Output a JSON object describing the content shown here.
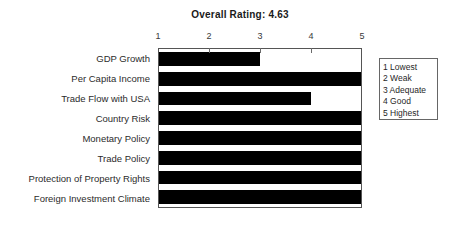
{
  "chart_data": {
    "type": "bar",
    "orientation": "horizontal",
    "title": "Overall Rating: 4.63",
    "xlabel": "",
    "ylabel": "",
    "xlim": [
      1,
      5
    ],
    "xticks": [
      1,
      2,
      3,
      4,
      5
    ],
    "xtick_labels": [
      "1",
      "2",
      "3",
      "4",
      "5"
    ],
    "grid": false,
    "bar_color": "#000000",
    "categories": [
      "GDP Growth",
      "Per Capita Income",
      "Trade Flow with USA",
      "Country Risk",
      "Monetary Policy",
      "Trade Policy",
      "Protection of Property Rights",
      "Foreign Investment Climate"
    ],
    "values": [
      3,
      5,
      4,
      5,
      5,
      5,
      5,
      5
    ],
    "legend_position": "right-outside",
    "legend": [
      "1 Lowest",
      "2 Weak",
      "3 Adequate",
      "4 Good",
      "5 Highest"
    ],
    "overall_rating": "4.63"
  }
}
